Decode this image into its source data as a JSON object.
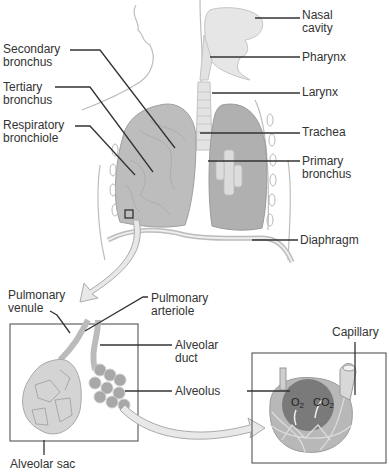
{
  "diagram": {
    "labels_right": [
      {
        "id": "nasal-cavity",
        "text": "Nasal\ncavity",
        "x": 302,
        "y": 9
      },
      {
        "id": "pharynx",
        "text": "Pharynx",
        "x": 302,
        "y": 51
      },
      {
        "id": "larynx",
        "text": "Larynx",
        "x": 302,
        "y": 86
      },
      {
        "id": "trachea",
        "text": "Trachea",
        "x": 302,
        "y": 125
      },
      {
        "id": "primary-bronchus",
        "text": "Primary\nbronchus",
        "x": 302,
        "y": 155
      },
      {
        "id": "diaphragm",
        "text": "Diaphragm",
        "x": 300,
        "y": 234
      }
    ],
    "labels_left": [
      {
        "id": "secondary-bronchus",
        "text": "Secondary\nbronchus",
        "x": 3,
        "y": 43
      },
      {
        "id": "tertiary-bronchus",
        "text": "Tertiary\nbronchus",
        "x": 3,
        "y": 81
      },
      {
        "id": "respiratory-bronchiole",
        "text": "Respiratory\nbronchiole",
        "x": 3,
        "y": 119
      }
    ],
    "labels_detail": [
      {
        "id": "pulmonary-venule",
        "text": "Pulmonary\nvenule",
        "x": 8,
        "y": 289
      },
      {
        "id": "pulmonary-arteriole",
        "text": "Pulmonary\narteriole",
        "x": 151,
        "y": 292
      },
      {
        "id": "alveolar-duct",
        "text": "Alveolar\nduct",
        "x": 175,
        "y": 340
      },
      {
        "id": "alveolus",
        "text": "Alveolus",
        "x": 175,
        "y": 386
      },
      {
        "id": "alveolar-sac",
        "text": "Alveolar sac",
        "x": 10,
        "y": 458
      },
      {
        "id": "capillary",
        "text": "Capillary",
        "x": 332,
        "y": 326
      }
    ],
    "gas_exchange": {
      "o2": "O",
      "o2_sub": "2",
      "co2": "CO",
      "co2_sub": "2"
    }
  }
}
